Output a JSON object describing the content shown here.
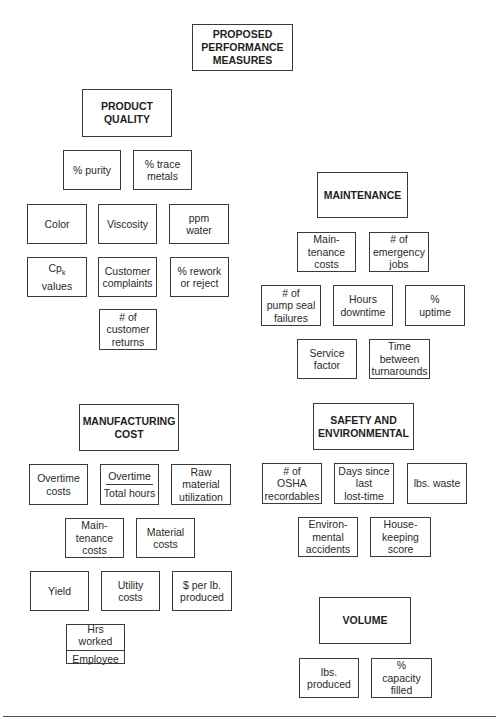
{
  "root": {
    "label": "PROPOSED\nPERFORMANCE\nMEASURES"
  },
  "categories": {
    "product_quality": {
      "label": "PRODUCT\nQUALITY",
      "items": [
        "% purity",
        "% trace\nmetals",
        "Color",
        "Viscosity",
        "ppm\nwater",
        "Cp",
        "values",
        "Customer\ncomplaints",
        "% rework\nor reject",
        "# of\ncustomer\nreturns"
      ],
      "cpk_subscript": "k"
    },
    "maintenance": {
      "label": "MAINTENANCE",
      "items": [
        "Main-\ntenance\ncosts",
        "# of\nemergency\njobs",
        "# of\npump seal\nfailures",
        "Hours\ndowntime",
        "%\nuptime",
        "Service\nfactor",
        "Time\nbetween\nturnarounds"
      ]
    },
    "manufacturing_cost": {
      "label": "MANUFACTURING\nCOST",
      "items": [
        "Overtime\ncosts",
        "Overtime",
        "Total hours",
        "Raw\nmaterial\nutilization",
        "Main-\ntenance\ncosts",
        "Material\ncosts",
        "Yield",
        "Utility\ncosts",
        "$ per lb.\nproduced",
        "Hrs worked",
        "Employee"
      ]
    },
    "safety_environmental": {
      "label": "SAFETY AND\nENVIRONMENTAL",
      "items": [
        "# of\nOSHA\nrecordables",
        "Days since\nlast\nlost-time",
        "lbs. waste",
        "Environ-\nmental\naccidents",
        "House-\nkeeping\nscore"
      ]
    },
    "volume": {
      "label": "VOLUME",
      "items": [
        "lbs.\nproduced",
        "%\ncapacity\nfilled"
      ]
    }
  },
  "colors": {
    "border": "#3a3a3a",
    "text": "#2a2a2a",
    "background": "#ffffff"
  }
}
